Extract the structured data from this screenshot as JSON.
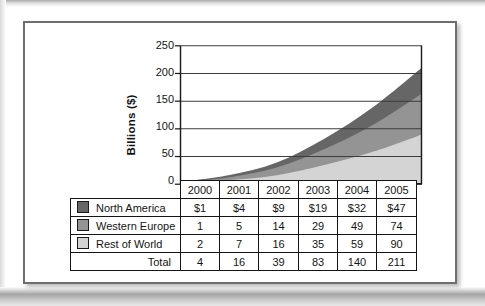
{
  "chart_data": {
    "type": "area",
    "stacked": true,
    "title": "",
    "ylabel": "Billions ($)",
    "xlabel": "",
    "categories": [
      "2000",
      "2001",
      "2002",
      "2003",
      "2004",
      "2005"
    ],
    "series": [
      {
        "name": "North America",
        "color": "#666666",
        "values": [
          1,
          4,
          9,
          19,
          32,
          47
        ]
      },
      {
        "name": "Western Europe",
        "color": "#949494",
        "values": [
          1,
          5,
          14,
          29,
          49,
          74
        ]
      },
      {
        "name": "Rest of World",
        "color": "#d4d4d4",
        "values": [
          2,
          7,
          16,
          35,
          59,
          90
        ]
      }
    ],
    "stack_order_bottom_to_top": [
      "Rest of World",
      "Western Europe",
      "North America"
    ],
    "totals": [
      4,
      16,
      39,
      83,
      140,
      211
    ],
    "ylim": [
      0,
      250
    ],
    "y_ticks": [
      0,
      50,
      100,
      150,
      200,
      250
    ],
    "grid": true,
    "legend_position": "table-left-column"
  },
  "table": {
    "header_row": [
      "2000",
      "2001",
      "2002",
      "2003",
      "2004",
      "2005"
    ],
    "rows": [
      {
        "label": "North America",
        "swatch_color": "#666666",
        "cells": [
          "$1",
          "$4",
          "$9",
          "$19",
          "$32",
          "$47"
        ]
      },
      {
        "label": "Western Europe",
        "swatch_color": "#949494",
        "cells": [
          "1",
          "5",
          "14",
          "29",
          "49",
          "74"
        ]
      },
      {
        "label": "Rest of World",
        "swatch_color": "#d4d4d4",
        "cells": [
          "2",
          "7",
          "16",
          "35",
          "59",
          "90"
        ]
      }
    ],
    "total_row": {
      "label": "Total",
      "cells": [
        "4",
        "16",
        "39",
        "83",
        "140",
        "211"
      ]
    }
  },
  "colors": {
    "grid_line": "#3d3d3d",
    "plot_border": "#1a1a1a",
    "frame_border": "#6e6e6e",
    "table_border": "#141414"
  }
}
